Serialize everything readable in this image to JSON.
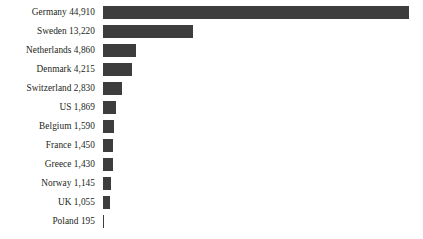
{
  "chart_data": {
    "type": "bar",
    "orientation": "horizontal",
    "title": "",
    "subtitle": "",
    "xlabel": "",
    "ylabel": "",
    "grid": false,
    "legend": false,
    "axis_visible": false,
    "xlim": [
      0,
      44910
    ],
    "bar_color": "#3d3d3d",
    "background_color": "#ffffff",
    "text_color": "#231f20",
    "categories": [
      "Germany",
      "Sweden",
      "Netherlands",
      "Denmark",
      "Switzerland",
      "US",
      "Belgium",
      "France",
      "Greece",
      "Norway",
      "UK",
      "Poland"
    ],
    "values": [
      44910,
      13220,
      4860,
      4215,
      2830,
      1869,
      1590,
      1450,
      1430,
      1145,
      1055,
      195
    ],
    "value_labels": [
      "44,910",
      "13,220",
      "4,860",
      "4,215",
      "2,830",
      "1,869",
      "1,590",
      "1,450",
      "1,430",
      "1,145",
      "1,055",
      "195"
    ]
  },
  "rows": [
    {
      "label": "Germany 44,910",
      "name": "germany",
      "value": 44910
    },
    {
      "label": "Sweden 13,220",
      "name": "sweden",
      "value": 13220
    },
    {
      "label": "Netherlands 4,860",
      "name": "netherlands",
      "value": 4860
    },
    {
      "label": "Denmark 4,215",
      "name": "denmark",
      "value": 4215
    },
    {
      "label": "Switzerland 2,830",
      "name": "switzerland",
      "value": 2830
    },
    {
      "label": "US 1,869",
      "name": "us",
      "value": 1869
    },
    {
      "label": "Belgium 1,590",
      "name": "belgium",
      "value": 1590
    },
    {
      "label": "France 1,450",
      "name": "france",
      "value": 1450
    },
    {
      "label": "Greece 1,430",
      "name": "greece",
      "value": 1430
    },
    {
      "label": "Norway 1,145",
      "name": "norway",
      "value": 1145
    },
    {
      "label": "UK 1,055",
      "name": "uk",
      "value": 1055
    },
    {
      "label": "Poland 195",
      "name": "poland",
      "value": 195
    }
  ],
  "layout": {
    "label_column_width_px": 95,
    "bar_origin_x_px": 103,
    "bar_max_width_px": 306,
    "bar_height_px": 13,
    "row_gap_px": 6
  }
}
